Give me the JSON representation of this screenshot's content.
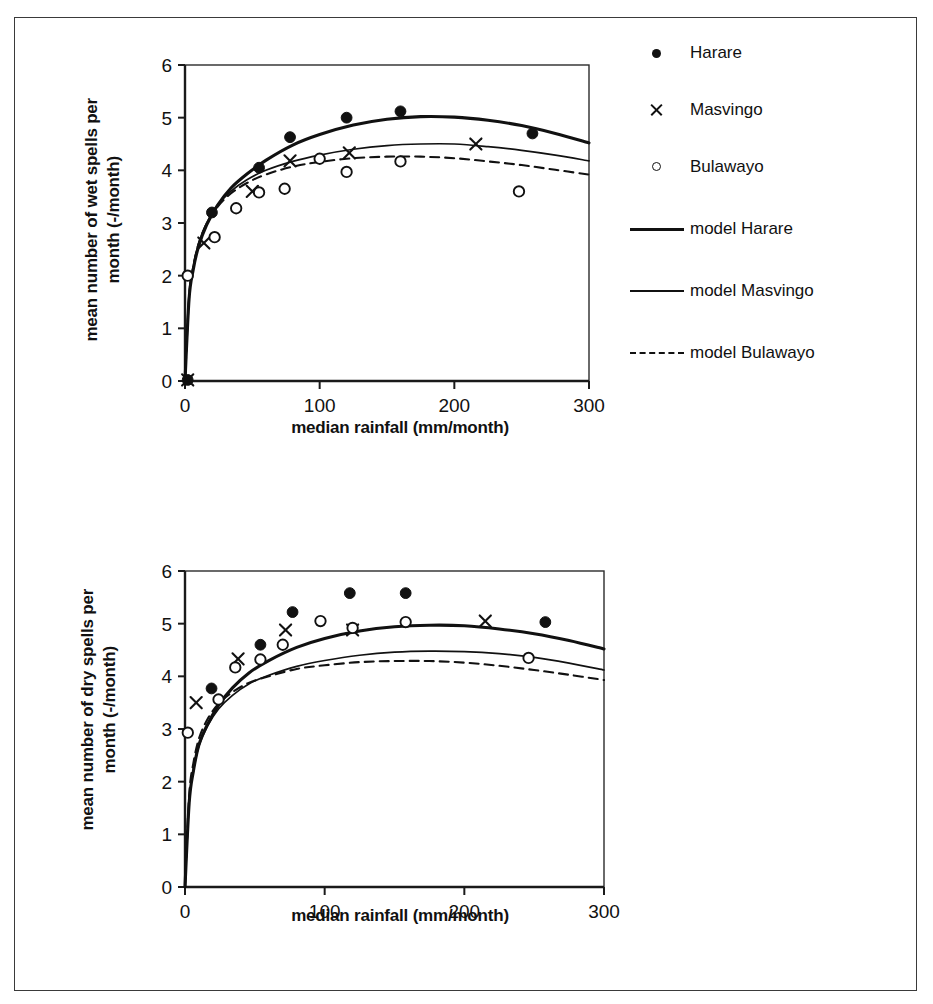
{
  "figure": {
    "border_color": "#3a3a3a",
    "background": "#ffffff"
  },
  "legend": {
    "items": [
      {
        "label": "Harare",
        "marker": "filled-circle-icon"
      },
      {
        "label": "Masvingo",
        "marker": "cross-marker-icon"
      },
      {
        "label": "Bulawayo",
        "marker": "open-circle-icon"
      },
      {
        "label": "model Harare",
        "marker": "thick-solid-line-icon"
      },
      {
        "label": "model Masvingo",
        "marker": "thin-solid-line-icon"
      },
      {
        "label": "model Bulawayo",
        "marker": "dashed-line-icon"
      }
    ]
  },
  "chart_data": [
    {
      "type": "scatter",
      "id": "wet-spells",
      "title": "",
      "xlabel": "median rainfall (mm/month)",
      "ylabel": "mean number of wet spells per\nmonth (-/month)",
      "xlim": [
        0,
        300
      ],
      "ylim": [
        0,
        6
      ],
      "xticks": [
        0,
        100,
        200,
        300
      ],
      "yticks": [
        0,
        1,
        2,
        3,
        4,
        5,
        6
      ],
      "xticklabels": [
        "0",
        "100",
        "200",
        "300"
      ],
      "yticklabels": [
        "0",
        "1",
        "2",
        "3",
        "4",
        "5",
        "6"
      ],
      "grid": false,
      "legend_position": "right",
      "series": [
        {
          "name": "Harare",
          "style": "filled-circle",
          "points": [
            [
              2,
              0.02
            ],
            [
              20,
              3.2
            ],
            [
              55,
              4.05
            ],
            [
              78,
              4.63
            ],
            [
              120,
              5.0
            ],
            [
              160,
              5.12
            ],
            [
              258,
              4.7
            ]
          ]
        },
        {
          "name": "Masvingo",
          "style": "cross",
          "points": [
            [
              2,
              0.02
            ],
            [
              14,
              2.62
            ],
            [
              50,
              3.6
            ],
            [
              78,
              4.18
            ],
            [
              122,
              4.33
            ],
            [
              216,
              4.5
            ]
          ]
        },
        {
          "name": "Bulawayo",
          "style": "open-circle",
          "points": [
            [
              2,
              2.0
            ],
            [
              22,
              2.73
            ],
            [
              38,
              3.28
            ],
            [
              55,
              3.58
            ],
            [
              74,
              3.65
            ],
            [
              100,
              4.22
            ],
            [
              120,
              3.97
            ],
            [
              160,
              4.17
            ],
            [
              248,
              3.6
            ]
          ]
        },
        {
          "name": "model Harare",
          "style": "thick-solid",
          "curve": [
            [
              0,
              0
            ],
            [
              3,
              1.55
            ],
            [
              6,
              2.1
            ],
            [
              10,
              2.55
            ],
            [
              16,
              2.96
            ],
            [
              24,
              3.33
            ],
            [
              34,
              3.66
            ],
            [
              46,
              3.93
            ],
            [
              60,
              4.19
            ],
            [
              80,
              4.48
            ],
            [
              100,
              4.68
            ],
            [
              125,
              4.86
            ],
            [
              150,
              4.97
            ],
            [
              175,
              5.02
            ],
            [
              200,
              5.01
            ],
            [
              225,
              4.95
            ],
            [
              250,
              4.85
            ],
            [
              275,
              4.7
            ],
            [
              300,
              4.52
            ]
          ]
        },
        {
          "name": "model Masvingo",
          "style": "thin-solid",
          "curve": [
            [
              0,
              0
            ],
            [
              3,
              1.6
            ],
            [
              6,
              2.15
            ],
            [
              10,
              2.6
            ],
            [
              16,
              3.0
            ],
            [
              24,
              3.33
            ],
            [
              34,
              3.6
            ],
            [
              46,
              3.82
            ],
            [
              60,
              4.0
            ],
            [
              80,
              4.17
            ],
            [
              100,
              4.29
            ],
            [
              125,
              4.4
            ],
            [
              150,
              4.47
            ],
            [
              175,
              4.5
            ],
            [
              200,
              4.5
            ],
            [
              225,
              4.45
            ],
            [
              250,
              4.38
            ],
            [
              275,
              4.29
            ],
            [
              300,
              4.18
            ]
          ]
        },
        {
          "name": "model Bulawayo",
          "style": "dashed",
          "curve": [
            [
              0,
              0
            ],
            [
              3,
              1.6
            ],
            [
              6,
              2.15
            ],
            [
              10,
              2.6
            ],
            [
              16,
              2.98
            ],
            [
              24,
              3.3
            ],
            [
              34,
              3.56
            ],
            [
              46,
              3.76
            ],
            [
              60,
              3.92
            ],
            [
              80,
              4.07
            ],
            [
              100,
              4.16
            ],
            [
              125,
              4.23
            ],
            [
              150,
              4.26
            ],
            [
              175,
              4.26
            ],
            [
              200,
              4.23
            ],
            [
              225,
              4.17
            ],
            [
              250,
              4.1
            ],
            [
              275,
              4.01
            ],
            [
              300,
              3.92
            ]
          ]
        }
      ]
    },
    {
      "type": "scatter",
      "id": "dry-spells",
      "title": "",
      "xlabel": "median rainfall (mm/month)",
      "ylabel": "mean number of dry spells per\nmonth (-/month)",
      "xlim": [
        0,
        300
      ],
      "ylim": [
        0,
        6
      ],
      "xticks": [
        0,
        100,
        200,
        300
      ],
      "yticks": [
        0,
        1,
        2,
        3,
        4,
        5,
        6
      ],
      "xticklabels": [
        "0",
        "100",
        "200",
        "300"
      ],
      "yticklabels": [
        "0",
        "1",
        "2",
        "3",
        "4",
        "5",
        "6"
      ],
      "grid": false,
      "legend_position": "none",
      "series": [
        {
          "name": "Harare",
          "style": "filled-circle",
          "points": [
            [
              19,
              3.77
            ],
            [
              54,
              4.6
            ],
            [
              77,
              5.22
            ],
            [
              118,
              5.58
            ],
            [
              158,
              5.58
            ],
            [
              258,
              5.03
            ]
          ]
        },
        {
          "name": "Masvingo",
          "style": "cross",
          "points": [
            [
              8,
              3.5
            ],
            [
              38,
              4.33
            ],
            [
              72,
              4.88
            ],
            [
              120,
              4.88
            ],
            [
              215,
              5.05
            ]
          ]
        },
        {
          "name": "Bulawayo",
          "style": "open-circle",
          "points": [
            [
              2,
              2.93
            ],
            [
              24,
              3.56
            ],
            [
              36,
              4.17
            ],
            [
              54,
              4.32
            ],
            [
              70,
              4.6
            ],
            [
              97,
              5.05
            ],
            [
              120,
              4.92
            ],
            [
              158,
              5.03
            ],
            [
              246,
              4.35
            ]
          ]
        },
        {
          "name": "model Harare",
          "style": "thick-solid",
          "curve": [
            [
              0,
              0
            ],
            [
              3,
              1.6
            ],
            [
              6,
              2.2
            ],
            [
              10,
              2.7
            ],
            [
              16,
              3.08
            ],
            [
              24,
              3.45
            ],
            [
              34,
              3.78
            ],
            [
              46,
              4.07
            ],
            [
              60,
              4.3
            ],
            [
              80,
              4.55
            ],
            [
              100,
              4.72
            ],
            [
              125,
              4.86
            ],
            [
              150,
              4.94
            ],
            [
              175,
              4.97
            ],
            [
              200,
              4.96
            ],
            [
              225,
              4.9
            ],
            [
              250,
              4.81
            ],
            [
              275,
              4.68
            ],
            [
              300,
              4.52
            ]
          ]
        },
        {
          "name": "model Masvingo",
          "style": "thin-solid",
          "curve": [
            [
              0,
              0
            ],
            [
              3,
              1.62
            ],
            [
              6,
              2.2
            ],
            [
              10,
              2.68
            ],
            [
              16,
              3.05
            ],
            [
              24,
              3.38
            ],
            [
              34,
              3.64
            ],
            [
              46,
              3.86
            ],
            [
              60,
              4.02
            ],
            [
              80,
              4.19
            ],
            [
              100,
              4.3
            ],
            [
              125,
              4.4
            ],
            [
              150,
              4.46
            ],
            [
              175,
              4.48
            ],
            [
              200,
              4.47
            ],
            [
              225,
              4.43
            ],
            [
              250,
              4.36
            ],
            [
              275,
              4.25
            ],
            [
              300,
              4.12
            ]
          ]
        },
        {
          "name": "model Bulawayo",
          "style": "dashed",
          "curve": [
            [
              0,
              0
            ],
            [
              3,
              1.75
            ],
            [
              6,
              2.35
            ],
            [
              10,
              2.82
            ],
            [
              16,
              3.18
            ],
            [
              24,
              3.48
            ],
            [
              34,
              3.7
            ],
            [
              46,
              3.88
            ],
            [
              60,
              4.0
            ],
            [
              80,
              4.14
            ],
            [
              100,
              4.21
            ],
            [
              125,
              4.27
            ],
            [
              150,
              4.29
            ],
            [
              175,
              4.29
            ],
            [
              200,
              4.26
            ],
            [
              225,
              4.2
            ],
            [
              250,
              4.12
            ],
            [
              275,
              4.03
            ],
            [
              300,
              3.93
            ]
          ]
        }
      ]
    }
  ]
}
